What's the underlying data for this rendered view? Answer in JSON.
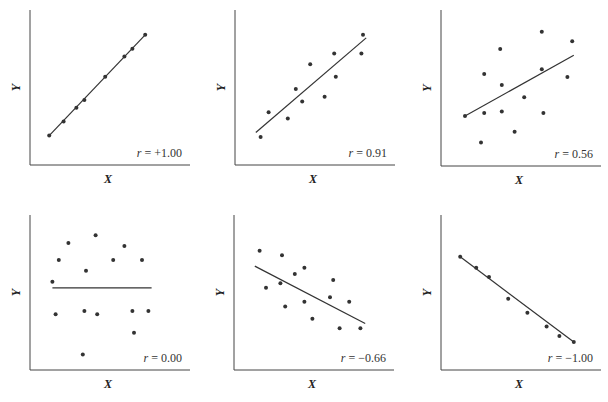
{
  "chart_data": [
    {
      "type": "scatter",
      "title": "",
      "annotation": "r = +1.00",
      "r_label": "r",
      "r_value": "= +1.00",
      "xlabel": "X",
      "ylabel": "Y",
      "grid": false,
      "frame": {
        "x": 30,
        "y": 10,
        "w": 160,
        "h": 155
      },
      "points": [
        [
          12,
          19
        ],
        [
          21,
          28
        ],
        [
          29,
          37
        ],
        [
          34,
          42
        ],
        [
          47,
          57
        ],
        [
          59,
          70
        ],
        [
          64,
          75
        ],
        [
          72,
          84
        ]
      ],
      "fit_line": [
        [
          12,
          19
        ],
        [
          72,
          84
        ]
      ]
    },
    {
      "type": "scatter",
      "title": "",
      "annotation": "r = 0.91",
      "r_label": "r",
      "r_value": "= 0.91",
      "xlabel": "X",
      "ylabel": "Y",
      "grid": false,
      "frame": {
        "x": 235,
        "y": 10,
        "w": 160,
        "h": 155
      },
      "points": [
        [
          16,
          18
        ],
        [
          21,
          34
        ],
        [
          33,
          30
        ],
        [
          38,
          49
        ],
        [
          42,
          41
        ],
        [
          47,
          65
        ],
        [
          56,
          44
        ],
        [
          62,
          72
        ],
        [
          63,
          57
        ],
        [
          79,
          72
        ],
        [
          80,
          84
        ]
      ],
      "fit_line": [
        [
          13,
          21
        ],
        [
          82,
          82
        ]
      ]
    },
    {
      "type": "scatter",
      "title": "",
      "annotation": "r = 0.56",
      "r_label": "r",
      "r_value": "= 0.56",
      "xlabel": "X",
      "ylabel": "Y",
      "grid": false,
      "frame": {
        "x": 441,
        "y": 10,
        "w": 160,
        "h": 156
      },
      "points": [
        [
          15,
          32
        ],
        [
          25,
          15
        ],
        [
          27,
          59
        ],
        [
          27,
          34
        ],
        [
          37,
          75
        ],
        [
          38,
          52
        ],
        [
          38,
          35
        ],
        [
          46,
          22
        ],
        [
          52,
          44
        ],
        [
          63,
          86
        ],
        [
          63,
          62
        ],
        [
          64,
          34
        ],
        [
          79,
          57
        ],
        [
          82,
          80
        ]
      ],
      "fit_line": [
        [
          15,
          32
        ],
        [
          83,
          71
        ]
      ]
    },
    {
      "type": "scatter",
      "title": "",
      "annotation": "r = 0.00",
      "r_label": "r",
      "r_value": "= 0.00",
      "xlabel": "X",
      "ylabel": "Y",
      "grid": false,
      "frame": {
        "x": 30,
        "y": 215,
        "w": 160,
        "h": 155
      },
      "points": [
        [
          14,
          57
        ],
        [
          16,
          36
        ],
        [
          18,
          71
        ],
        [
          24,
          82
        ],
        [
          33,
          10
        ],
        [
          34,
          38
        ],
        [
          35,
          64
        ],
        [
          41,
          87
        ],
        [
          42,
          36
        ],
        [
          52,
          71
        ],
        [
          59,
          80
        ],
        [
          64,
          38
        ],
        [
          65,
          24
        ],
        [
          70,
          71
        ],
        [
          74,
          38
        ]
      ],
      "fit_line": [
        [
          14,
          53
        ],
        [
          76,
          53
        ]
      ]
    },
    {
      "type": "scatter",
      "title": "",
      "annotation": "r = -0.66",
      "r_label": "r",
      "r_value": "= −0.66",
      "xlabel": "X",
      "ylabel": "Y",
      "grid": false,
      "frame": {
        "x": 234,
        "y": 215,
        "w": 160,
        "h": 155
      },
      "points": [
        [
          16,
          77
        ],
        [
          20,
          53
        ],
        [
          29,
          56
        ],
        [
          30,
          74
        ],
        [
          32,
          41
        ],
        [
          38,
          62
        ],
        [
          44,
          44
        ],
        [
          44,
          66
        ],
        [
          49,
          33
        ],
        [
          60,
          47
        ],
        [
          62,
          58
        ],
        [
          66,
          27
        ],
        [
          72,
          44
        ],
        [
          79,
          27
        ]
      ],
      "fit_line": [
        [
          13,
          67
        ],
        [
          82,
          30
        ]
      ]
    },
    {
      "type": "scatter",
      "title": "",
      "annotation": "r = -1.00",
      "r_label": "r",
      "r_value": "= −1.00",
      "xlabel": "X",
      "ylabel": "Y",
      "grid": false,
      "frame": {
        "x": 441,
        "y": 215,
        "w": 160,
        "h": 155
      },
      "points": [
        [
          12,
          73
        ],
        [
          22,
          66
        ],
        [
          30,
          60
        ],
        [
          42,
          46
        ],
        [
          54,
          37
        ],
        [
          66,
          28
        ],
        [
          74,
          22
        ],
        [
          83,
          18
        ]
      ],
      "fit_line": [
        [
          12,
          73
        ],
        [
          83,
          18
        ]
      ]
    }
  ]
}
